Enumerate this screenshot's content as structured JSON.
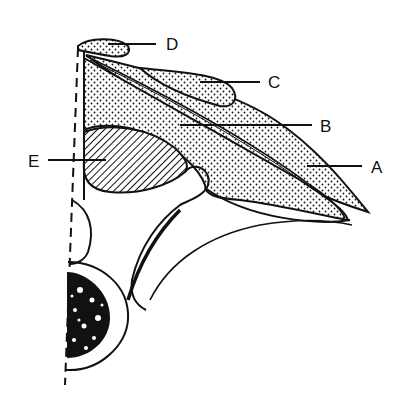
{
  "diagram": {
    "type": "anatomical-line-drawing",
    "colors": {
      "ink": "#111111",
      "background": "#ffffff"
    },
    "labels": [
      {
        "id": "A",
        "text": "A",
        "x": 371,
        "y": 173
      },
      {
        "id": "B",
        "text": "B",
        "x": 320,
        "y": 132
      },
      {
        "id": "C",
        "text": "C",
        "x": 268,
        "y": 88
      },
      {
        "id": "D",
        "text": "D",
        "x": 166,
        "y": 48
      },
      {
        "id": "E",
        "text": "E",
        "x": 28,
        "y": 166
      }
    ],
    "regions": [
      {
        "label": "A",
        "fill": "stipple"
      },
      {
        "label": "B",
        "fill": "stipple"
      },
      {
        "label": "C",
        "fill": "stipple"
      },
      {
        "label": "D",
        "fill": "stipple"
      },
      {
        "label": "E",
        "fill": "hatched"
      }
    ]
  }
}
